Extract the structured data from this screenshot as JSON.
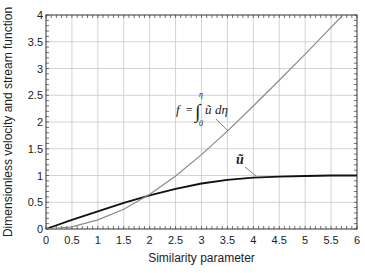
{
  "chart_data": {
    "type": "line",
    "title": "",
    "xlabel": "Similarity parameter",
    "ylabel": "Dimensionless velocity and stream function",
    "xlim": [
      0,
      6
    ],
    "ylim": [
      0,
      4
    ],
    "grid": true,
    "x_ticks": [
      "0",
      "0.5",
      "1",
      "1.5",
      "2",
      "2.5",
      "3",
      "3.5",
      "4",
      "4.5",
      "5",
      "5.5",
      "6"
    ],
    "y_ticks": [
      "0",
      "0.5",
      "1",
      "1.5",
      "2",
      "2.5",
      "3",
      "3.5",
      "4"
    ],
    "series": [
      {
        "name": "u_bar",
        "label": "ū",
        "color": "#111111",
        "x": [
          0,
          0.5,
          1,
          1.5,
          2,
          2.5,
          3,
          3.5,
          4,
          4.5,
          5,
          5.5,
          6
        ],
        "values": [
          0,
          0.17,
          0.33,
          0.49,
          0.63,
          0.75,
          0.85,
          0.92,
          0.96,
          0.98,
          0.99,
          1.0,
          1.0
        ]
      },
      {
        "name": "f",
        "label": "f = ∫₀^η ū dη",
        "color": "#8a8a8a",
        "x": [
          0,
          0.5,
          1,
          1.5,
          2,
          2.5,
          3,
          3.5,
          4,
          4.5,
          5,
          5.4
        ],
        "values": [
          0,
          0.04,
          0.17,
          0.37,
          0.65,
          0.99,
          1.39,
          1.83,
          2.3,
          2.78,
          3.27,
          3.67
        ]
      }
    ],
    "annotations": [
      {
        "text_f": "f",
        "text_eq": "=",
        "text_int": "∫",
        "upper": "η",
        "lower": "0",
        "integrand": "ũ",
        "d": "dη",
        "target_series": "f",
        "at_x": 3.0
      },
      {
        "text": "ũ",
        "target_series": "u_bar",
        "at_x": 4.2
      }
    ],
    "legend": "none"
  }
}
